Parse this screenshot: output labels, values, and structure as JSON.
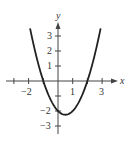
{
  "chart_data": {
    "type": "line",
    "title": "",
    "function": "y = x^2 - x - 2",
    "xlabel": "x",
    "ylabel": "y",
    "xlim": [
      -2.6,
      3.8
    ],
    "ylim": [
      -3.6,
      4.2
    ],
    "x_ticks": [
      -2,
      -1,
      1,
      2,
      3
    ],
    "x_tick_labels": [
      "-2",
      "1",
      "3"
    ],
    "y_ticks": [
      -3,
      -2,
      -1,
      1,
      2,
      3
    ],
    "y_tick_labels": [
      "-3",
      "-2",
      "1",
      "2",
      "3"
    ],
    "grid": false,
    "series": [
      {
        "name": "parabola",
        "x": [
          -1.9,
          -1.5,
          -1,
          -0.5,
          0,
          0.5,
          1,
          1.5,
          2,
          2.5,
          2.9
        ],
        "y": [
          3.51,
          1.75,
          0,
          -1.25,
          -2,
          -2.25,
          -2,
          -1.25,
          0,
          1.75,
          3.51
        ]
      }
    ]
  },
  "labels": {
    "x_axis": "x",
    "y_axis": "y",
    "xt_m2": "−2",
    "xt_1": "1",
    "xt_3": "3",
    "yt_3": "3",
    "yt_2": "2",
    "yt_1": "1",
    "yt_m2": "−2",
    "yt_m3": "−3"
  }
}
